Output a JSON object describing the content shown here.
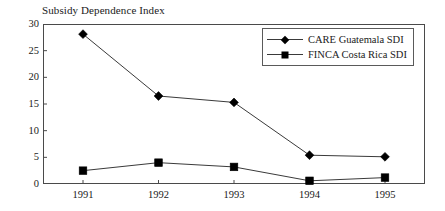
{
  "chart_data": {
    "type": "line",
    "title": "Subsidy Dependence Index",
    "xlabel": "",
    "ylabel": "",
    "categories": [
      "1991",
      "1992",
      "1993",
      "1994",
      "1995"
    ],
    "series": [
      {
        "name": "CARE Guatemala SDI",
        "marker": "diamond",
        "values": [
          28.1,
          16.5,
          15.3,
          5.4,
          5.1
        ]
      },
      {
        "name": "FINCA Costa Rica SDI",
        "marker": "square",
        "values": [
          2.5,
          4.0,
          3.2,
          0.6,
          1.2
        ]
      }
    ],
    "ylim": [
      0,
      30
    ],
    "yticks": [
      0,
      5,
      10,
      15,
      20,
      25,
      30
    ],
    "ytick_labels": [
      "0",
      "5",
      "10",
      "15",
      "20",
      "25",
      "30"
    ],
    "grid": false,
    "legend_position": "top-right",
    "colors": {
      "line": "#3a3a3a",
      "marker": "#000000",
      "axis": "#4a4a4a",
      "text": "#1a1a1a",
      "background": "#ffffff"
    }
  }
}
